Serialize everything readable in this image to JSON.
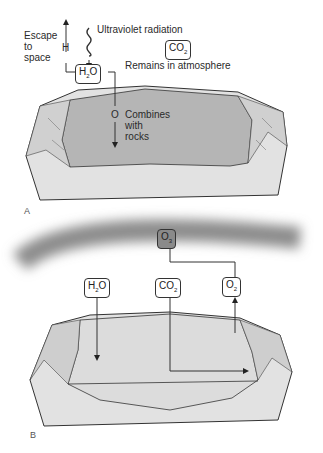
{
  "panel_a": {
    "letter": "A",
    "escape_label": [
      "Escape",
      "to",
      "space"
    ],
    "h_label": "H",
    "uv_label": "Ultraviolet radiation",
    "h2o_box": {
      "main": "H",
      "sub": "2",
      "tail": "O"
    },
    "co2_box": {
      "main": "CO",
      "sub": "2"
    },
    "remains_label": "Remains in atmosphere",
    "o_label": "O",
    "combines_label": [
      "Combines",
      "with",
      "rocks"
    ]
  },
  "panel_b": {
    "letter": "B",
    "o3_box": {
      "main": "O",
      "sub": "3"
    },
    "h2o_box": {
      "main": "H",
      "sub": "2",
      "tail": "O"
    },
    "co2_box": {
      "main": "CO",
      "sub": "2"
    },
    "o2_box": {
      "main": "O",
      "sub": "2"
    }
  },
  "colors": {
    "water": "#b9b9b9",
    "land": "#e2e2e2",
    "ozone": "#8c8c8c",
    "line": "#333333"
  }
}
